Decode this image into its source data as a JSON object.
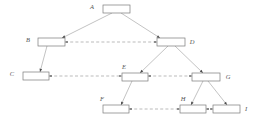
{
  "diagram": {
    "type": "tree-with-level-links",
    "canvas": {
      "width": 256,
      "height": 127,
      "background": "#ffffff"
    },
    "colors": {
      "box_stroke": "#7a7a7a",
      "box_fill": "#ffffff",
      "solid_edge": "#9a9a9a",
      "dashed_edge": "#8f8f8f",
      "arrow_fill": "#4a4a4a",
      "label_text": "#555555"
    },
    "nodes": [
      {
        "id": "A",
        "label": "A",
        "x": 103,
        "y": 5,
        "w": 27,
        "h": 8,
        "label_x": 92,
        "label_y": 9
      },
      {
        "id": "B",
        "label": "B",
        "x": 38,
        "y": 38,
        "w": 27,
        "h": 8,
        "label_x": 28,
        "label_y": 42
      },
      {
        "id": "D",
        "label": "D",
        "x": 157,
        "y": 38,
        "w": 28,
        "h": 8,
        "label_x": 192,
        "label_y": 44
      },
      {
        "id": "C",
        "label": "C",
        "x": 23,
        "y": 72,
        "w": 26,
        "h": 8,
        "label_x": 12,
        "label_y": 76
      },
      {
        "id": "E",
        "label": "E",
        "x": 122,
        "y": 73,
        "w": 26,
        "h": 8,
        "label_x": 124,
        "label_y": 69
      },
      {
        "id": "G",
        "label": "G",
        "x": 192,
        "y": 73,
        "w": 28,
        "h": 8,
        "label_x": 228,
        "label_y": 79
      },
      {
        "id": "F",
        "label": "F",
        "x": 103,
        "y": 105,
        "w": 26,
        "h": 8,
        "label_x": 102,
        "label_y": 101
      },
      {
        "id": "H",
        "label": "H",
        "x": 180,
        "y": 105,
        "w": 26,
        "h": 8,
        "label_x": 183,
        "label_y": 101
      },
      {
        "id": "I",
        "label": "I",
        "x": 213,
        "y": 105,
        "w": 27,
        "h": 8,
        "label_x": 246,
        "label_y": 111
      }
    ],
    "solid_edges": [
      {
        "from": "A",
        "to": "B",
        "x1": 112,
        "y1": 13,
        "x2": 62,
        "y2": 38
      },
      {
        "from": "A",
        "to": "D",
        "x1": 121,
        "y1": 13,
        "x2": 160,
        "y2": 38
      },
      {
        "from": "B",
        "to": "C",
        "x1": 47,
        "y1": 46,
        "x2": 40,
        "y2": 72
      },
      {
        "from": "D",
        "to": "E",
        "x1": 168,
        "y1": 46,
        "x2": 140,
        "y2": 73
      },
      {
        "from": "D",
        "to": "G",
        "x1": 175,
        "y1": 46,
        "x2": 203,
        "y2": 73
      },
      {
        "from": "E",
        "to": "F",
        "x1": 132,
        "y1": 81,
        "x2": 121,
        "y2": 105
      },
      {
        "from": "G",
        "to": "H",
        "x1": 203,
        "y1": 81,
        "x2": 191,
        "y2": 105
      },
      {
        "from": "G",
        "to": "I",
        "x1": 208,
        "y1": 81,
        "x2": 227,
        "y2": 105
      }
    ],
    "dashed_edges": [
      {
        "from": "B",
        "to": "D",
        "x1": 65,
        "y1": 42,
        "x2": 157,
        "y2": 42,
        "arrows": "both"
      },
      {
        "from": "C",
        "to": "E",
        "x1": 49,
        "y1": 76,
        "x2": 122,
        "y2": 76,
        "arrows": "both"
      },
      {
        "from": "E",
        "to": "G",
        "x1": 148,
        "y1": 76,
        "x2": 192,
        "y2": 76,
        "arrows": "both"
      },
      {
        "from": "F",
        "to": "H",
        "x1": 129,
        "y1": 109,
        "x2": 180,
        "y2": 109,
        "arrows": "both"
      },
      {
        "from": "H",
        "to": "I",
        "x1": 206,
        "y1": 109,
        "x2": 213,
        "y2": 109,
        "arrows": "both"
      }
    ],
    "edge_arrow_targets": [
      {
        "edge": "A-B",
        "x": 62,
        "y": 38,
        "angle": 153
      },
      {
        "edge": "A-D",
        "x": 160,
        "y": 38,
        "angle": 33
      },
      {
        "edge": "B-C",
        "x": 40,
        "y": 72,
        "angle": 105
      },
      {
        "edge": "D-E",
        "x": 140,
        "y": 73,
        "angle": 136
      },
      {
        "edge": "D-G",
        "x": 203,
        "y": 73,
        "angle": 44
      },
      {
        "edge": "E-F",
        "x": 121,
        "y": 105,
        "angle": 115
      },
      {
        "edge": "G-H",
        "x": 191,
        "y": 105,
        "angle": 117
      },
      {
        "edge": "G-I",
        "x": 227,
        "y": 105,
        "angle": 52
      }
    ]
  }
}
